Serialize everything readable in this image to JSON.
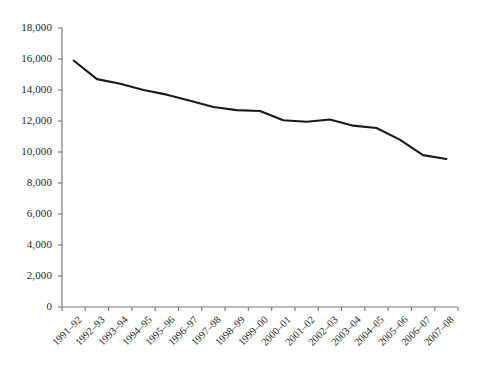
{
  "chart_data": {
    "type": "line",
    "title": "",
    "subtitle": "",
    "xlabel": "",
    "ylabel": "",
    "categories": [
      "1991–92",
      "1992–93",
      "1993–94",
      "1994–95",
      "1995–96",
      "1996–97",
      "1997–98",
      "1998–99",
      "1999–00",
      "2000–01",
      "2001–02",
      "2002–03",
      "2003–04",
      "2004–05",
      "2005–06",
      "2006–07",
      "2007–08"
    ],
    "series": [
      {
        "name": "",
        "values": [
          15900,
          14700,
          14400,
          14000,
          13700,
          13300,
          12900,
          12700,
          12650,
          12050,
          11950,
          12100,
          11700,
          11550,
          10800,
          9800,
          9550
        ]
      }
    ],
    "ylim": [
      0,
      18000
    ],
    "ytick_labels": [
      "18,000",
      "16,000",
      "14,000",
      "12,000",
      "10,000",
      "8,000",
      "6,000",
      "4,000",
      "2,000",
      "0"
    ],
    "ytick_values": [
      18000,
      16000,
      14000,
      12000,
      10000,
      8000,
      6000,
      4000,
      2000,
      0
    ],
    "grid": false,
    "legend": false,
    "legend_position": "none",
    "line_color": "#1a1a1a",
    "axis_color": "#7b7b7b",
    "background_color": "#ffffff"
  }
}
